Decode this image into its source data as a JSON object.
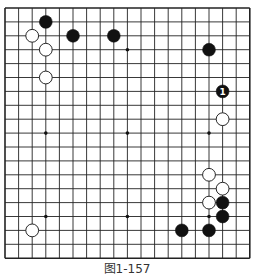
{
  "board": {
    "size": 19,
    "origin_x": 5,
    "origin_y": 8,
    "step_x": 13.6,
    "step_y": 13.9,
    "line_color": "#222222",
    "star_points": [
      [
        3,
        3
      ],
      [
        9,
        3
      ],
      [
        15,
        3
      ],
      [
        3,
        9
      ],
      [
        9,
        9
      ],
      [
        15,
        9
      ],
      [
        3,
        15
      ],
      [
        9,
        15
      ],
      [
        15,
        15
      ]
    ],
    "stones": [
      {
        "color": "black",
        "col": 3,
        "row": 1
      },
      {
        "color": "white",
        "col": 2,
        "row": 2
      },
      {
        "color": "black",
        "col": 5,
        "row": 2
      },
      {
        "color": "black",
        "col": 8,
        "row": 2
      },
      {
        "color": "white",
        "col": 3,
        "row": 3
      },
      {
        "color": "white",
        "col": 3,
        "row": 5
      },
      {
        "color": "black",
        "col": 15,
        "row": 3
      },
      {
        "color": "black",
        "col": 16,
        "row": 6,
        "label": "1"
      },
      {
        "color": "white",
        "col": 16,
        "row": 8
      },
      {
        "color": "white",
        "col": 15,
        "row": 12
      },
      {
        "color": "white",
        "col": 16,
        "row": 13
      },
      {
        "color": "white",
        "col": 15,
        "row": 14
      },
      {
        "color": "black",
        "col": 16,
        "row": 14
      },
      {
        "color": "black",
        "col": 16,
        "row": 15
      },
      {
        "color": "black",
        "col": 15,
        "row": 16
      },
      {
        "color": "black",
        "col": 13,
        "row": 16
      },
      {
        "color": "white",
        "col": 2,
        "row": 16
      }
    ]
  },
  "caption": "图1-157"
}
